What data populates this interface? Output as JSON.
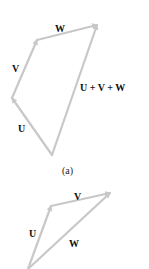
{
  "figure_a": {
    "caption": "(a)",
    "labels": {
      "U": "U",
      "V": "V",
      "W": "W",
      "sum": "U + V + W"
    }
  },
  "figure_b": {
    "labels": {
      "U": "U",
      "V": "V",
      "W": "W"
    }
  },
  "colors": {
    "vector": "#c8c8c8",
    "label": "#111111"
  }
}
